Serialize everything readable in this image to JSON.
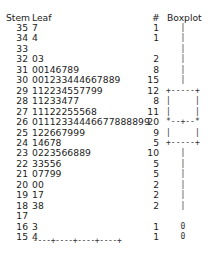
{
  "header": {
    "stem": "Stem",
    "leaf": "Leaf",
    "count": "#",
    "boxplot": "Boxplot"
  },
  "rows": [
    {
      "stem": "35",
      "leaf": "7",
      "count": "1",
      "box": "   |"
    },
    {
      "stem": "34",
      "leaf": "4",
      "count": "1",
      "box": "   |"
    },
    {
      "stem": "33",
      "leaf": "",
      "count": "",
      "box": "   |"
    },
    {
      "stem": "32",
      "leaf": "03",
      "count": "2",
      "box": "   |"
    },
    {
      "stem": "31",
      "leaf": "00146789",
      "count": "8",
      "box": "   |"
    },
    {
      "stem": "30",
      "leaf": "001233444667889",
      "count": "15",
      "box": "   |"
    },
    {
      "stem": "29",
      "leaf": "112234557799",
      "count": "12",
      "box": "+-----+"
    },
    {
      "stem": "28",
      "leaf": "11233477",
      "count": "8",
      "box": "|     |"
    },
    {
      "stem": "27",
      "leaf": "11122255568",
      "count": "11",
      "box": "|     |"
    },
    {
      "stem": "26",
      "leaf": "01112334446677888899",
      "count": "20",
      "box": "*--+--*"
    },
    {
      "stem": "25",
      "leaf": "122667999",
      "count": "9",
      "box": "|     |"
    },
    {
      "stem": "24",
      "leaf": "14678",
      "count": "5",
      "box": "+-----+"
    },
    {
      "stem": "23",
      "leaf": "0223566889",
      "count": "10",
      "box": "   |"
    },
    {
      "stem": "22",
      "leaf": "33556",
      "count": "5",
      "box": "   |"
    },
    {
      "stem": "21",
      "leaf": "07799",
      "count": "5",
      "box": "   |"
    },
    {
      "stem": "20",
      "leaf": "00",
      "count": "2",
      "box": "   |"
    },
    {
      "stem": "19",
      "leaf": "17",
      "count": "2",
      "box": "   |"
    },
    {
      "stem": "18",
      "leaf": "38",
      "count": "2",
      "box": "   |"
    },
    {
      "stem": "17",
      "leaf": "",
      "count": "",
      "box": ""
    },
    {
      "stem": "16",
      "leaf": "3",
      "count": "1",
      "box": "   0"
    },
    {
      "stem": "15",
      "leaf": "4",
      "count": "1",
      "box": "   0"
    }
  ],
  "axis": "----+----+----+----+",
  "chart_data": {
    "type": "table",
    "columns": [
      "Stem",
      "Leaf",
      "#",
      "Boxplot"
    ],
    "stems": [
      35,
      34,
      33,
      32,
      31,
      30,
      29,
      28,
      27,
      26,
      25,
      24,
      23,
      22,
      21,
      20,
      19,
      18,
      17,
      16,
      15
    ],
    "leaves": [
      "7",
      "4",
      "",
      "03",
      "00146789",
      "001233444667889",
      "112234557799",
      "11233477",
      "11122255568",
      "01112334446677888899",
      "122667999",
      "14678",
      "0223566889",
      "33556",
      "07799",
      "00",
      "17",
      "38",
      "",
      "3",
      "4"
    ],
    "counts": [
      1,
      1,
      0,
      2,
      8,
      15,
      12,
      8,
      11,
      20,
      9,
      5,
      10,
      5,
      5,
      2,
      2,
      2,
      0,
      1,
      1
    ],
    "boxplot": {
      "box_top_stem": 29,
      "median_stem": 26,
      "box_bottom_stem": 24,
      "whisker_top_stem": 35,
      "whisker_bottom_stem": 18,
      "outliers_stems": [
        16,
        15
      ],
      "outlier_marker": "0"
    },
    "axis_ticks": "----+----+----+----+"
  }
}
